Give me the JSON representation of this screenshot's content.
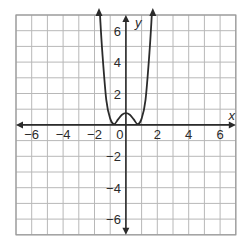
{
  "chart_data": {
    "type": "line",
    "title": "",
    "xlabel": "x",
    "ylabel": "y",
    "xlim": [
      -7,
      7
    ],
    "ylim": [
      -7,
      7
    ],
    "grid": true,
    "grid_step": 1,
    "x_ticks": [
      -6,
      -4,
      -2,
      0,
      2,
      4,
      6
    ],
    "y_ticks": [
      -6,
      -4,
      -2,
      2,
      4,
      6
    ],
    "x_tick_labels": [
      "−6",
      "−4",
      "−2",
      "0",
      "2",
      "4",
      "6"
    ],
    "y_tick_labels": [
      "−6",
      "−4",
      "−2",
      "2",
      "4",
      "6"
    ],
    "origin_label": "0",
    "series": [
      {
        "name": "f(x)",
        "description": "even quartic-like curve, W shape, arrows at both ends pointing up",
        "x": [
          -1.65,
          -1.5,
          -1.25,
          -1.0,
          -0.75,
          -0.5,
          -0.25,
          0,
          0.25,
          0.5,
          0.75,
          1.0,
          1.25,
          1.5,
          1.65
        ],
        "y": [
          7.0,
          4.6,
          1.6,
          0.4,
          0.05,
          0.35,
          0.65,
          0.75,
          0.65,
          0.35,
          0.05,
          0.4,
          1.6,
          4.6,
          7.0
        ]
      }
    ],
    "colors": {
      "grid": "#b8b8b8",
      "axis": "#2b2b2b",
      "curve": "#2b2b2b",
      "border": "#9a9a9a"
    }
  }
}
